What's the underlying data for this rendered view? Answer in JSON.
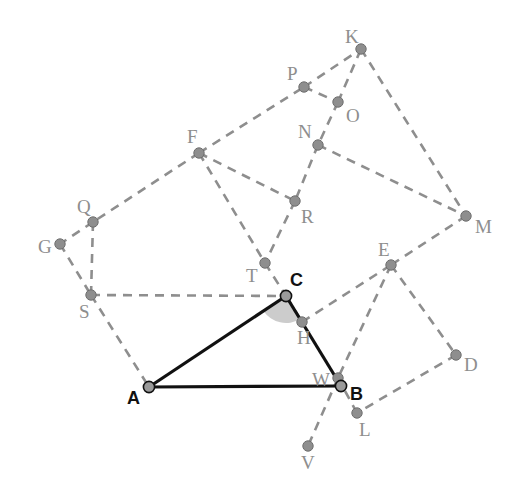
{
  "figure": {
    "canvas": {
      "width": 517,
      "height": 503,
      "background": "#ffffff"
    },
    "colors": {
      "dashed_stroke": "#8e8e8e",
      "solid_stroke": "#111111",
      "dot_fill": "#8e8e8e",
      "dot_stroke": "#6f6f6f",
      "primary_dot_fill": "#9a9a9a",
      "primary_dot_stroke": "#111111",
      "angle_fill": "#b8b8b8",
      "label_gray": "#8e8e8e",
      "label_black": "#111111"
    },
    "points": [
      {
        "id": "K",
        "label": "K",
        "x": 361,
        "y": 49,
        "style": "gray",
        "label_dx": -16,
        "label_dy": -22
      },
      {
        "id": "P",
        "label": "P",
        "x": 304,
        "y": 87,
        "style": "gray",
        "label_dx": -17,
        "label_dy": -23
      },
      {
        "id": "O",
        "label": "O",
        "x": 338,
        "y": 102,
        "style": "gray",
        "label_dx": 8,
        "label_dy": 4
      },
      {
        "id": "N",
        "label": "N",
        "x": 318,
        "y": 145,
        "style": "gray",
        "label_dx": -20,
        "label_dy": -23
      },
      {
        "id": "F",
        "label": "F",
        "x": 199,
        "y": 153,
        "style": "gray",
        "label_dx": -12,
        "label_dy": -26
      },
      {
        "id": "M",
        "label": "M",
        "x": 466,
        "y": 216,
        "style": "gray",
        "label_dx": 9,
        "label_dy": 1
      },
      {
        "id": "R",
        "label": "R",
        "x": 295,
        "y": 201,
        "style": "gray",
        "label_dx": 6,
        "label_dy": 6
      },
      {
        "id": "Q",
        "label": "Q",
        "x": 93,
        "y": 222,
        "style": "gray",
        "label_dx": -16,
        "label_dy": -25
      },
      {
        "id": "G",
        "label": "G",
        "x": 60,
        "y": 244,
        "style": "gray",
        "label_dx": -22,
        "label_dy": -7
      },
      {
        "id": "E",
        "label": "E",
        "x": 391,
        "y": 265,
        "style": "gray",
        "label_dx": -13,
        "label_dy": -25
      },
      {
        "id": "T",
        "label": "T",
        "x": 265,
        "y": 263,
        "style": "gray",
        "label_dx": -19,
        "label_dy": 3
      },
      {
        "id": "S",
        "label": "S",
        "x": 91,
        "y": 295,
        "style": "gray",
        "label_dx": -12,
        "label_dy": 7
      },
      {
        "id": "C",
        "label": "C",
        "x": 286,
        "y": 296,
        "style": "primary",
        "label_dx": 4,
        "label_dy": -25
      },
      {
        "id": "H",
        "label": "H",
        "x": 302,
        "y": 322,
        "style": "gray",
        "label_dx": -5,
        "label_dy": 6
      },
      {
        "id": "D",
        "label": "D",
        "x": 456,
        "y": 355,
        "style": "gray",
        "label_dx": 8,
        "label_dy": 0
      },
      {
        "id": "A",
        "label": "A",
        "x": 149,
        "y": 387,
        "style": "primary",
        "label_dx": -22,
        "label_dy": 2
      },
      {
        "id": "W",
        "label": "W",
        "x": 338,
        "y": 378,
        "style": "gray",
        "label_dx": -26,
        "label_dy": -8
      },
      {
        "id": "B",
        "label": "B",
        "x": 341,
        "y": 386,
        "style": "primary",
        "label_dx": 9,
        "label_dy": -1
      },
      {
        "id": "L",
        "label": "L",
        "x": 357,
        "y": 413,
        "style": "gray",
        "label_dx": 2,
        "label_dy": 7
      },
      {
        "id": "V",
        "label": "V",
        "x": 308,
        "y": 446,
        "style": "gray",
        "label_dx": -7,
        "label_dy": 7
      }
    ],
    "dashed_edges": [
      [
        "F",
        "P"
      ],
      [
        "P",
        "K"
      ],
      [
        "P",
        "O"
      ],
      [
        "O",
        "K"
      ],
      [
        "K",
        "M"
      ],
      [
        "O",
        "N"
      ],
      [
        "N",
        "M"
      ],
      [
        "N",
        "R"
      ],
      [
        "F",
        "R"
      ],
      [
        "F",
        "T"
      ],
      [
        "R",
        "T"
      ],
      [
        "F",
        "Q"
      ],
      [
        "Q",
        "G"
      ],
      [
        "Q",
        "S"
      ],
      [
        "G",
        "S"
      ],
      [
        "S",
        "C"
      ],
      [
        "S",
        "A"
      ],
      [
        "T",
        "C"
      ],
      [
        "M",
        "E"
      ],
      [
        "C",
        "H"
      ],
      [
        "H",
        "E"
      ],
      [
        "E",
        "D"
      ],
      [
        "E",
        "W"
      ],
      [
        "W",
        "V"
      ],
      [
        "D",
        "L"
      ],
      [
        "L",
        "W"
      ]
    ],
    "solid_edges": [
      [
        "A",
        "C"
      ],
      [
        "C",
        "B"
      ],
      [
        "A",
        "B"
      ]
    ],
    "angle_marker": {
      "at": "C",
      "from": "A",
      "to": "B",
      "radius": 27,
      "note": "shaded angle ACB at vertex C"
    },
    "dot_radius_gray": 5.2,
    "dot_radius_primary": 5.6,
    "dash_pattern": "9 7",
    "dash_width": 2.6,
    "solid_width": 3.2
  }
}
